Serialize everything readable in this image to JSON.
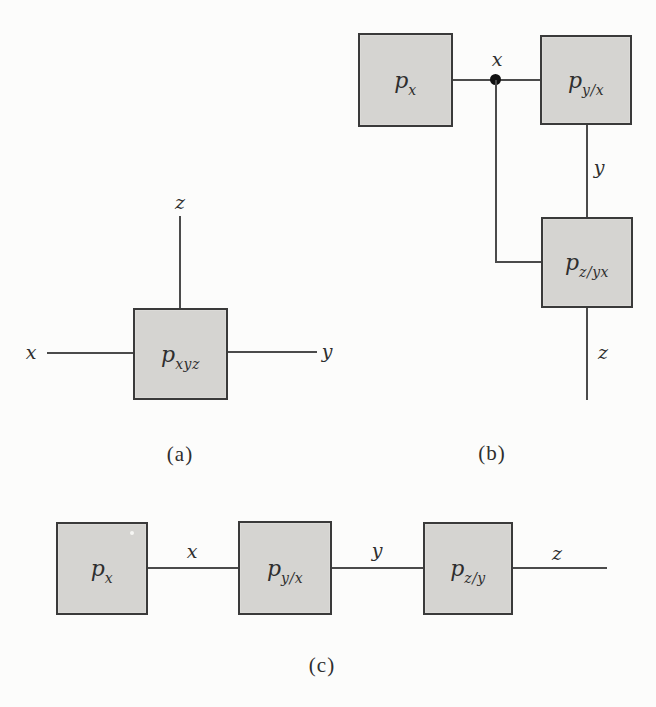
{
  "canvas": {
    "width": 656,
    "height": 707
  },
  "style": {
    "canvas_bg": "#fcfcfb",
    "box_fill": "#d5d4d1",
    "box_border": "#3a3a3a",
    "line_color": "#4b4b4b",
    "dot_color": "#111111",
    "text_color": "#2e2e2e"
  },
  "figures": {
    "a": {
      "caption": "(a)",
      "node_pxyz": {
        "base": "p",
        "sub": "xyz"
      },
      "edge_labels": {
        "x": "x",
        "y": "y",
        "z": "z"
      }
    },
    "b": {
      "caption": "(b)",
      "node_px": {
        "base": "p",
        "sub": "x"
      },
      "node_pyx": {
        "base": "p",
        "sub": "y/x"
      },
      "node_pzyx": {
        "base": "p",
        "sub": "z/yx"
      },
      "edge_labels": {
        "x": "x",
        "y": "y",
        "z": "z"
      }
    },
    "c": {
      "caption": "(c)",
      "node_px": {
        "base": "p",
        "sub": "x"
      },
      "node_pyx": {
        "base": "p",
        "sub": "y/x"
      },
      "node_pzy": {
        "base": "p",
        "sub": "z/y"
      },
      "edge_labels": {
        "x": "x",
        "y": "y",
        "z": "z"
      }
    }
  }
}
